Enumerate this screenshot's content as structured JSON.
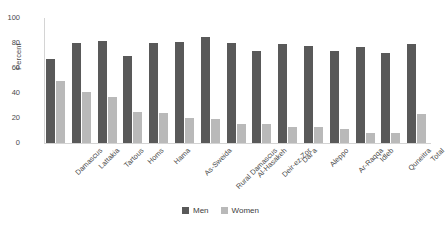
{
  "chart_data": {
    "type": "bar",
    "title": "",
    "xlabel": "",
    "ylabel": "Percent",
    "ylim": [
      0,
      100
    ],
    "yticks": [
      0,
      20,
      40,
      60,
      80,
      100
    ],
    "grid": false,
    "legend_position": "bottom-center",
    "categories": [
      "Damascus",
      "Lattakia",
      "Tartous",
      "Homs",
      "Hama",
      "As-Sweida",
      "Rural Damascus",
      "Al-Hasakeh",
      "Deir-ez-Zor",
      "Dar'a",
      "Aleppo",
      "Ar-Raqqa",
      "Idleb",
      "Quneitra",
      "Total"
    ],
    "series": [
      {
        "name": "Men",
        "color": "#595959",
        "values": [
          67,
          80,
          82,
          70,
          80,
          81,
          85,
          80,
          74,
          79,
          78,
          74,
          77,
          72,
          79
        ]
      },
      {
        "name": "Women",
        "color": "#b9b9b9",
        "values": [
          50,
          41,
          37,
          25,
          24,
          20,
          19,
          15,
          15,
          13,
          13,
          11,
          8,
          8,
          23
        ]
      }
    ]
  },
  "legend": {
    "items": [
      {
        "label": "Men",
        "color": "#595959",
        "swatch_name": "legend-swatch-men"
      },
      {
        "label": "Women",
        "color": "#b9b9b9",
        "swatch_name": "legend-swatch-women"
      }
    ]
  }
}
